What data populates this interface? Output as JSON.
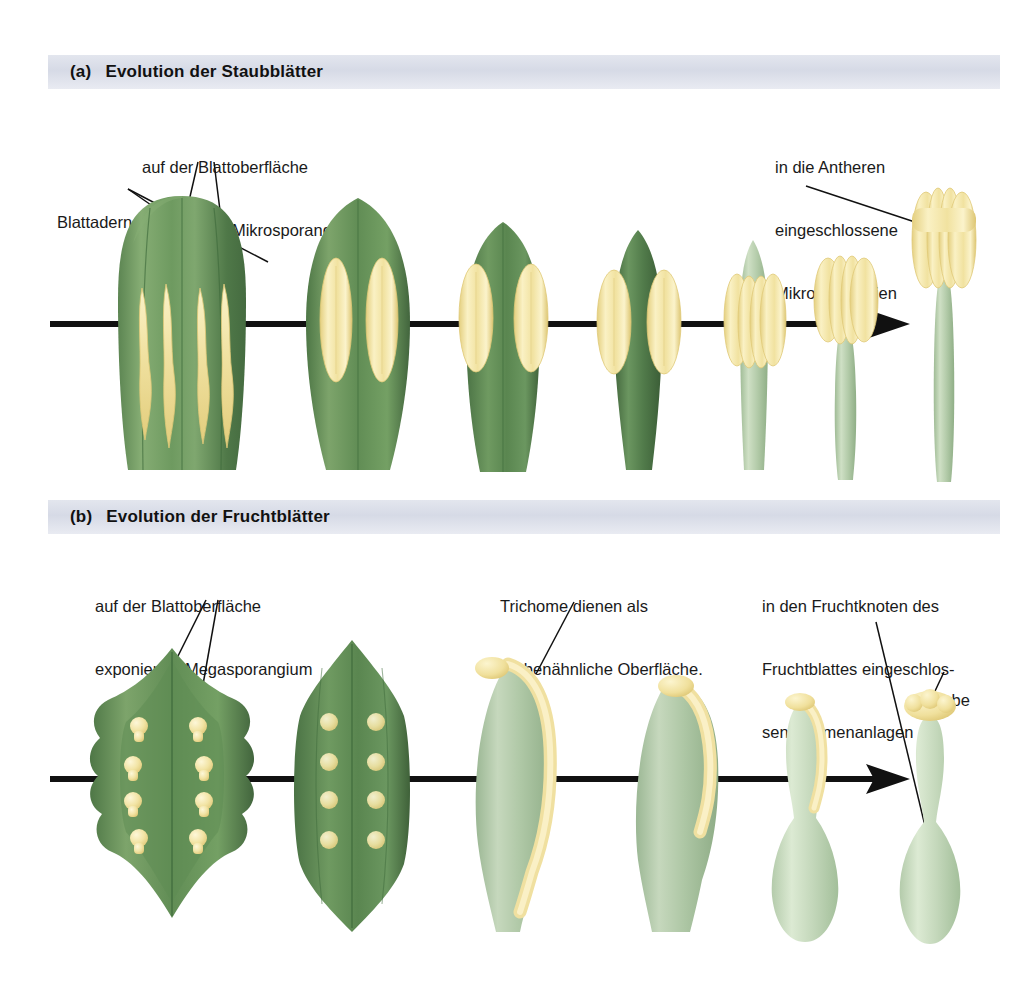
{
  "figure": {
    "kind": "botanical-evolution-diagram",
    "language": "de",
    "background": "#ffffff",
    "width": 1036,
    "height": 1000
  },
  "panels": [
    {
      "id": "a",
      "letter": "(a)",
      "title": "Evolution der Staubblätter",
      "bar": {
        "x": 48,
        "y": 55,
        "width": 952,
        "height": 34,
        "color": "#dde1ea"
      },
      "axis": {
        "x1": 50,
        "y": 324,
        "x2": 880,
        "arrow": true,
        "color": "#111111"
      },
      "labels": [
        {
          "name": "label-blattadern",
          "lines": [
            "Blattadern"
          ],
          "x": 57,
          "y": 170,
          "leaders": [
            [
              [
                148,
                196
              ],
              [
                183,
                232
              ]
            ],
            [
              [
                148,
                196
              ],
              [
                262,
                258
              ]
            ]
          ]
        },
        {
          "name": "label-exponiertes-mikrosporangium",
          "lines": [
            "auf der Blattoberfläche",
            "exponiertes Mikrosporangium"
          ],
          "x": 142,
          "y": 115,
          "leaders": [
            [
              [
                205,
                163
              ],
              [
                170,
                290
              ]
            ],
            [
              [
                212,
                163
              ],
              [
                227,
                290
              ]
            ]
          ]
        },
        {
          "name": "label-eingeschlossene-mikrosporangien",
          "lines": [
            "in die Antheren",
            "eingeschlossene",
            "Mikrosporangien"
          ],
          "x": 775,
          "y": 115,
          "leaders": [
            [
              [
                836,
                187
              ],
              [
                930,
                222
              ]
            ]
          ]
        }
      ],
      "stages": [
        {
          "name": "stage-1-broad-leaf-four-sporangia",
          "cx": 182,
          "sporangia": 4
        },
        {
          "name": "stage-2-narrow-leaf-two-sporangia",
          "cx": 358,
          "sporangia": 2
        },
        {
          "name": "stage-3-leaf-marginal-sporangia",
          "cx": 503,
          "sporangia": 2
        },
        {
          "name": "stage-4-narrow-axis-sporangia",
          "cx": 638,
          "sporangia": 2
        },
        {
          "name": "stage-5-filament-forming",
          "cx": 753,
          "sporangia": 4
        },
        {
          "name": "stage-6-short-filament-anther",
          "cx": 845,
          "sporangia": 4
        },
        {
          "name": "stage-7-mature-stamen",
          "cx": 944,
          "sporangia": 4
        }
      ]
    },
    {
      "id": "b",
      "letter": "(b)",
      "title": "Evolution der Fruchtblätter",
      "bar": {
        "x": 48,
        "y": 500,
        "width": 952,
        "height": 34,
        "color": "#dde1ea"
      },
      "axis": {
        "x1": 50,
        "y": 779,
        "x2": 880,
        "arrow": true,
        "color": "#111111"
      },
      "labels": [
        {
          "name": "label-exponiertes-megasporangium",
          "lines": [
            "auf der Blattoberfläche",
            "exponiertes Megasporangium"
          ],
          "x": 95,
          "y": 554,
          "leaders": [
            [
              [
                210,
                600
              ],
              [
                137,
                730
              ]
            ],
            [
              [
                222,
                600
              ],
              [
                196,
                723
              ]
            ]
          ]
        },
        {
          "name": "label-trichome",
          "lines": [
            "Trichome dienen als",
            "narbenähnliche Oberfläche."
          ],
          "x": 500,
          "y": 554,
          "leaders": [
            [
              [
                578,
                602
              ],
              [
                538,
                672
              ]
            ]
          ]
        },
        {
          "name": "label-eingeschlossene-samenanlagen",
          "lines": [
            "in den Fruchtknoten des",
            "Fruchtblattes eingeschlos-",
            "sene Samenanlagen"
          ],
          "x": 762,
          "y": 554,
          "leaders": [
            [
              [
                880,
                622
              ],
              [
                930,
                853
              ]
            ]
          ]
        },
        {
          "name": "label-narbe",
          "lines": [
            "Narbe"
          ],
          "x": 925,
          "y": 648,
          "leaders": [
            [
              [
                940,
                672
              ],
              [
                926,
                706
              ]
            ]
          ]
        }
      ],
      "stages": [
        {
          "name": "stage-1-leaf-eight-ovules",
          "cx": 172,
          "ovules": 8
        },
        {
          "name": "stage-2-folding-leaf-ovules",
          "cx": 352,
          "ovules": 8
        },
        {
          "name": "stage-3-folded-carpel-trichome-ridge",
          "cx": 508,
          "ovules": 0
        },
        {
          "name": "stage-4-closed-carpel-short-ridge",
          "cx": 670,
          "ovules": 0
        },
        {
          "name": "stage-5-pistil-forming",
          "cx": 805,
          "ovules": 0
        },
        {
          "name": "stage-6-mature-pistil-with-stigma",
          "cx": 930,
          "ovules": 0
        }
      ]
    }
  ],
  "palette": {
    "leaf_dark": "#4e7a4a",
    "leaf_mid": "#6f9b62",
    "leaf_light": "#9dbd8b",
    "leaf_pale": "#b9cfae",
    "carpel_green": "#adc6a6",
    "carpel_pale": "#cfdec8",
    "sporangium_yellow": "#f3e7a8",
    "sporangium_deep": "#e8d47e",
    "vein": "#3f6b3c",
    "line": "#111111",
    "header_bar": "#dde1ea",
    "text": "#1a1a1a"
  }
}
